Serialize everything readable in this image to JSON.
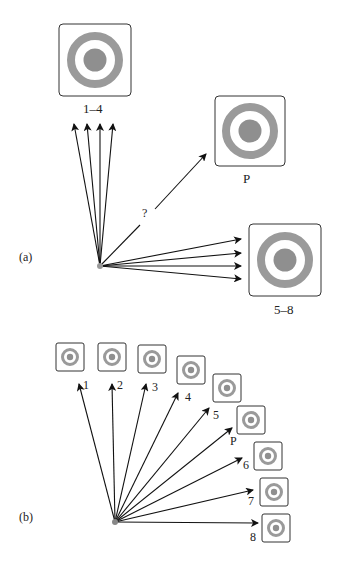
{
  "panel_a": {
    "label": "(a)",
    "targets": [
      {
        "id": "1-4",
        "label": "1–4"
      },
      {
        "id": "P",
        "label": "P"
      },
      {
        "id": "5-8",
        "label": "5–8"
      }
    ],
    "question_label": "?"
  },
  "panel_b": {
    "label": "(b)",
    "targets": [
      {
        "label": "1"
      },
      {
        "label": "2"
      },
      {
        "label": "3"
      },
      {
        "label": "4"
      },
      {
        "label": "5"
      },
      {
        "label": "P"
      },
      {
        "label": "6"
      },
      {
        "label": "7"
      },
      {
        "label": "8"
      }
    ]
  },
  "colors": {
    "ring": "#9a9a9a",
    "center": "#8f8f8f",
    "frame": "#333333",
    "arrow": "#111111"
  }
}
